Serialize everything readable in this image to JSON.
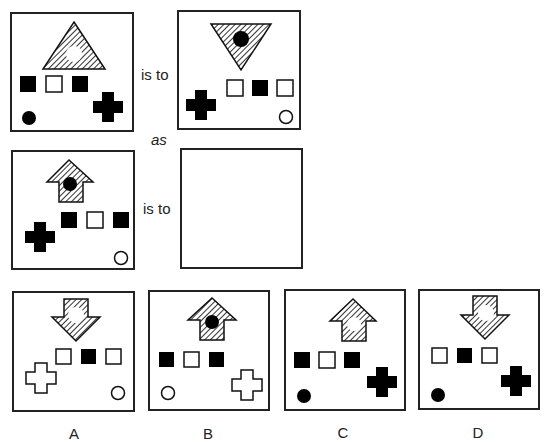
{
  "puzzle": {
    "connector_is_to": "is to",
    "connector_as": "as",
    "pattern_fill": "#555555",
    "ink": "#000000",
    "panels": {
      "a": {
        "description": "hatched upward triangle with white circle; squares filled-empty-filled; black circle bottom-left; black cross bottom-right"
      },
      "b": {
        "description": "hatched downward triangle with black circle; black cross bottom-left; squares empty-filled-empty; white circle bottom-right"
      },
      "c": {
        "description": "hatched upward arrow with black circle; black cross left; squares filled-empty-filled; white circle bottom-right"
      },
      "d": {
        "description": "empty answer box"
      }
    },
    "options": [
      {
        "label": "A",
        "description": "hatched downward arrow with white circle; squares empty-filled-empty; white cross bottom-left; white circle bottom-right"
      },
      {
        "label": "B",
        "description": "hatched upward arrow with black circle; squares filled-empty-filled; white circle bottom-left; white cross bottom-right"
      },
      {
        "label": "C",
        "description": "hatched upward arrow with white circle; squares filled-empty-filled; black circle bottom-left; black cross bottom-right"
      },
      {
        "label": "D",
        "description": "hatched downward arrow with white circle; squares empty-filled-empty; black circle bottom-left; black cross bottom-right"
      }
    ]
  }
}
